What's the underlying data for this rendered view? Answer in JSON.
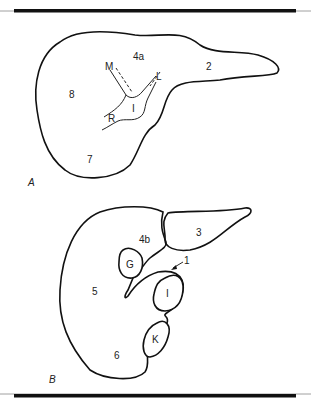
{
  "figure": {
    "panels": [
      {
        "id": "A",
        "label": "A",
        "segments": [
          "2",
          "4a",
          "7",
          "8"
        ],
        "vessels": [
          "M",
          "L",
          "R",
          "I"
        ]
      },
      {
        "id": "B",
        "label": "B",
        "segments": [
          "3",
          "4b",
          "5",
          "6",
          "1"
        ],
        "structures": [
          "G",
          "I",
          "K"
        ]
      }
    ],
    "colors": {
      "stroke": "#111111",
      "background": "#ffffff",
      "rule": "#111111"
    }
  },
  "labels": {
    "a": {
      "panel": "A",
      "seg2": "2",
      "seg4a": "4a",
      "seg7": "7",
      "seg8": "8",
      "m": "M",
      "l": "L",
      "r": "R",
      "i": "I"
    },
    "b": {
      "panel": "B",
      "seg3": "3",
      "seg4b": "4b",
      "seg5": "5",
      "seg6": "6",
      "seg1": "1",
      "g": "G",
      "i": "I",
      "k": "K"
    }
  }
}
